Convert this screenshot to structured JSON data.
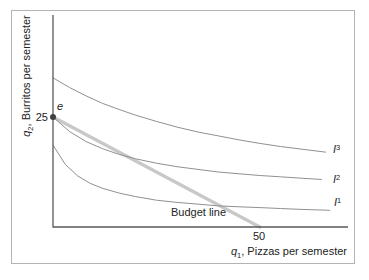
{
  "figure": {
    "point_label": "e",
    "y_tick": "25",
    "x_tick": "50",
    "budget_label": "Budget line",
    "y_axis": {
      "var": "q",
      "sub": "2",
      "rest": ", Burritos per semester"
    },
    "x_axis": {
      "var": "q",
      "sub": "1",
      "rest": ", Pizzas per semester"
    },
    "curve_labels": [
      {
        "base": "I",
        "sup": "1"
      },
      {
        "base": "I",
        "sup": "2"
      },
      {
        "base": "I",
        "sup": "3"
      }
    ]
  },
  "colors": {
    "budget_line": "#c7c9c6",
    "indifference_curve": "#8f9092",
    "axis": "#58595b",
    "point": "#3f4041",
    "text": "#232323",
    "border": "#b1b3b4"
  },
  "chart_data": {
    "type": "line",
    "title": "",
    "xlabel": "q1, Pizzas per semester",
    "ylabel": "q2, Burritos per semester",
    "xlim": [
      0,
      71
    ],
    "ylim": [
      0,
      48
    ],
    "grid": false,
    "x_ticks": [
      50
    ],
    "y_ticks": [
      25
    ],
    "series": [
      {
        "name": "Budget line",
        "kind": "budget",
        "points": [
          [
            0,
            25
          ],
          [
            50,
            0
          ]
        ]
      },
      {
        "name": "I1",
        "kind": "indifference",
        "points": [
          [
            0,
            18.6
          ],
          [
            3,
            14.2
          ],
          [
            6,
            11.6
          ],
          [
            9,
            9.9
          ],
          [
            12,
            8.8
          ],
          [
            16,
            7.7
          ],
          [
            20,
            6.9
          ],
          [
            25,
            6.1
          ],
          [
            30,
            5.6
          ],
          [
            35,
            5.2
          ],
          [
            40,
            4.8
          ],
          [
            45,
            4.6
          ],
          [
            50,
            4.4
          ],
          [
            55,
            4.2
          ],
          [
            60,
            4.0
          ],
          [
            67,
            3.8
          ]
        ]
      },
      {
        "name": "I2",
        "kind": "indifference",
        "points": [
          [
            0,
            25.0
          ],
          [
            4,
            21.7
          ],
          [
            8,
            19.4
          ],
          [
            12,
            17.8
          ],
          [
            16,
            16.5
          ],
          [
            20,
            15.5
          ],
          [
            25,
            14.5
          ],
          [
            30,
            13.7
          ],
          [
            35,
            13.1
          ],
          [
            40,
            12.5
          ],
          [
            45,
            12.1
          ],
          [
            50,
            11.7
          ],
          [
            55,
            11.4
          ],
          [
            60,
            11.1
          ],
          [
            65,
            10.8
          ]
        ]
      },
      {
        "name": "I3",
        "kind": "indifference",
        "points": [
          [
            0,
            33.9
          ],
          [
            4,
            31.7
          ],
          [
            8,
            29.8
          ],
          [
            12,
            28.1
          ],
          [
            16,
            26.7
          ],
          [
            20,
            25.4
          ],
          [
            25,
            24.0
          ],
          [
            30,
            22.7
          ],
          [
            35,
            21.6
          ],
          [
            40,
            20.7
          ],
          [
            45,
            19.8
          ],
          [
            50,
            19.0
          ],
          [
            55,
            18.3
          ],
          [
            60,
            17.7
          ],
          [
            66,
            17.0
          ]
        ]
      }
    ],
    "annotations": [
      {
        "label": "e",
        "x": 0,
        "y": 25
      }
    ]
  }
}
